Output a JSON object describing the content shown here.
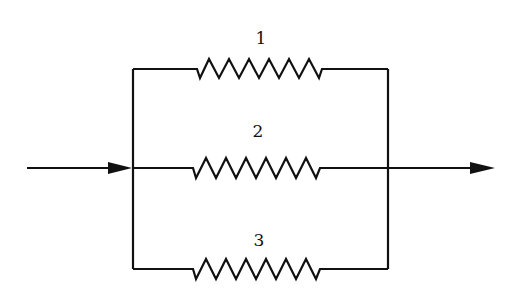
{
  "diagram": {
    "resistors": [
      {
        "label": "1",
        "branch": "top"
      },
      {
        "label": "2",
        "branch": "middle"
      },
      {
        "label": "3",
        "branch": "bottom"
      }
    ],
    "input": "inflow-arrow",
    "output": "outflow-arrow",
    "colors": {
      "stroke": "#111111",
      "background": "#ffffff"
    }
  }
}
